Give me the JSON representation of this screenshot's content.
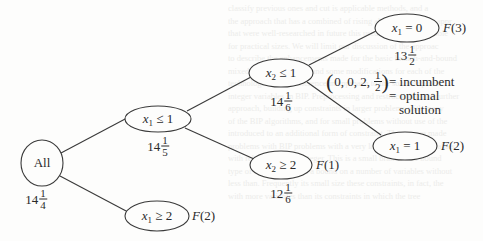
{
  "diagram": {
    "type": "branch-and-bound-tree",
    "nodes": [
      {
        "id": "all",
        "label": "All",
        "bound_whole": "14",
        "bound_num": "1",
        "bound_den": "4",
        "fathom": ""
      },
      {
        "id": "x1le1",
        "var": "x",
        "sub": "1",
        "op": "≤",
        "val": "1",
        "bound_whole": "14",
        "bound_num": "1",
        "bound_den": "5",
        "fathom": ""
      },
      {
        "id": "x1ge2",
        "var": "x",
        "sub": "1",
        "op": "≥",
        "val": "2",
        "bound_whole": "",
        "bound_num": "",
        "bound_den": "",
        "fathom_F": "F",
        "fathom_n": "(2)"
      },
      {
        "id": "x2le1",
        "var": "x",
        "sub": "2",
        "op": "≤",
        "val": "1",
        "bound_whole": "14",
        "bound_num": "1",
        "bound_den": "6",
        "fathom": ""
      },
      {
        "id": "x2ge2",
        "var": "x",
        "sub": "2",
        "op": "≥",
        "val": "2",
        "bound_whole": "12",
        "bound_num": "1",
        "bound_den": "6",
        "fathom_F": "F",
        "fathom_n": "(1)"
      },
      {
        "id": "x1eq0",
        "var": "x",
        "sub": "1",
        "op": "=",
        "val": "0",
        "bound_whole": "13",
        "bound_num": "1",
        "bound_den": "2",
        "fathom_F": "F",
        "fathom_n": "(3)"
      },
      {
        "id": "x1eq1",
        "var": "x",
        "sub": "1",
        "op": "=",
        "val": "1",
        "bound_whole": "",
        "bound_num": "",
        "bound_den": "",
        "fathom_F": "F",
        "fathom_n": "(2)"
      }
    ],
    "edges": [
      [
        "all",
        "x1le1"
      ],
      [
        "all",
        "x1ge2"
      ],
      [
        "x1le1",
        "x2le1"
      ],
      [
        "x1le1",
        "x2ge2"
      ],
      [
        "x2le1",
        "x1eq0"
      ],
      [
        "x2le1",
        "x1eq1"
      ]
    ],
    "incumbent": {
      "vector_prefix": "0, 0, 2,",
      "vector_frac_num": "1",
      "vector_frac_den": "2",
      "line1": "= incumbent",
      "line2": "= optimal",
      "line3": "solution"
    }
  },
  "ghost_text": [
    "classify previous ones and cut is applicable methods, and a",
    "the approach that has a combined of rising ahead on both the appr",
    "that were well-researched in future this used to solve MIP proble",
    "for practical sizes. We will limit our discussion of the approac",
    "to describe the enhancements made for the basic branch-and-bound",
    "mixed-integer problems and some modifications for each of the",
    "technologies. As a difference in approach to the solution proce",
    "integer variables in BIP. Preprocessing and restructuring and further",
    "approach, building up constraints in larger problems with many",
    "of the BIP algorithms, and for small problems without use of the",
    "introduced to an additional form of constraint. These were made",
    "problems with BIP problems with a very large number of variables",
    "with relatively many integer. This is a small branch-and-bound",
    "type of constraints with a bound on a number of variables without",
    "less than. Frequently its small size these constraints, in fact, the",
    "with more variables than its constraints in which the tree"
  ]
}
